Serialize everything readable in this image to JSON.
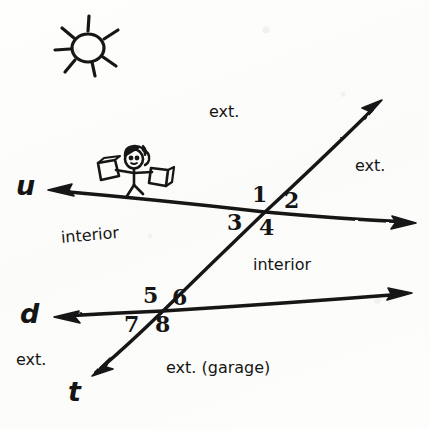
{
  "diagram": {
    "ink_color": "#151515",
    "paper_color": "#fdfdfc",
    "line_labels": [
      {
        "name": "line-u",
        "text": "u",
        "x": 16,
        "y": 172
      },
      {
        "name": "line-d",
        "text": "d",
        "x": 20,
        "y": 300
      },
      {
        "name": "line-t",
        "text": "t",
        "x": 68,
        "y": 378
      }
    ],
    "angle_numbers": [
      {
        "name": "angle-1",
        "text": "1",
        "x": 252,
        "y": 183
      },
      {
        "name": "angle-2",
        "text": "2",
        "x": 284,
        "y": 189
      },
      {
        "name": "angle-3",
        "text": "3",
        "x": 227,
        "y": 211
      },
      {
        "name": "angle-4",
        "text": "4",
        "x": 259,
        "y": 216
      },
      {
        "name": "angle-5",
        "text": "5",
        "x": 143,
        "y": 284
      },
      {
        "name": "angle-6",
        "text": "6",
        "x": 172,
        "y": 286
      },
      {
        "name": "angle-7",
        "text": "7",
        "x": 124,
        "y": 313
      },
      {
        "name": "angle-8",
        "text": "8",
        "x": 155,
        "y": 313
      }
    ],
    "region_labels": [
      {
        "name": "exterior-top",
        "text": "ext.",
        "x": 209,
        "y": 104,
        "slant": false
      },
      {
        "name": "exterior-right",
        "text": "ext.",
        "x": 355,
        "y": 158,
        "slant": false
      },
      {
        "name": "interior-left",
        "text": "interior",
        "x": 61,
        "y": 230,
        "slant": true
      },
      {
        "name": "interior-right",
        "text": "interior",
        "x": 253,
        "y": 257,
        "slant": false
      },
      {
        "name": "exterior-left-bottom",
        "text": "ext.",
        "x": 16,
        "y": 352,
        "slant": false
      },
      {
        "name": "exterior-bottom-garage",
        "text": "ext. (garage)",
        "x": 166,
        "y": 360,
        "slant": false
      }
    ],
    "lines": [
      {
        "name": "line-u-stroke",
        "label": "u",
        "type": "double-arrow",
        "from": {
          "x": 48,
          "y": 190
        },
        "to": {
          "x": 416,
          "y": 223
        }
      },
      {
        "name": "line-d-stroke",
        "label": "d",
        "type": "double-arrow",
        "from": {
          "x": 54,
          "y": 317
        },
        "to": {
          "x": 412,
          "y": 293
        }
      },
      {
        "name": "line-t-stroke",
        "label": "t",
        "type": "double-arrow",
        "from": {
          "x": 382,
          "y": 100
        },
        "to": {
          "x": 92,
          "y": 376
        }
      }
    ],
    "intersections": [
      {
        "name": "intersection-upper",
        "x": 265,
        "y": 212,
        "angles": [
          "1",
          "2",
          "3",
          "4"
        ]
      },
      {
        "name": "intersection-lower",
        "x": 163,
        "y": 311,
        "angles": [
          "5",
          "6",
          "7",
          "8"
        ]
      }
    ],
    "doodles": [
      {
        "name": "sun-doodle",
        "cx": 88,
        "cy": 48,
        "rays": 7
      },
      {
        "name": "stick-figure-doodle",
        "cx": 133,
        "cy": 170
      }
    ]
  }
}
